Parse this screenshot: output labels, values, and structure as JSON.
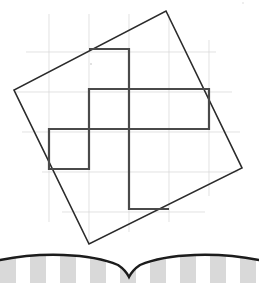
{
  "page": {
    "background_color": "#ffffff",
    "width": 259,
    "height": 283
  },
  "figure": {
    "name": "pinwheel-in-rotated-square",
    "grid": {
      "visible": true,
      "color": "#d6d6d6",
      "stroke_width": 0.7,
      "spacing": 40,
      "vertical_lines_x": [
        49,
        89,
        129,
        169,
        209
      ],
      "horizontal_lines_y": [
        52,
        92,
        132,
        172,
        212
      ]
    },
    "rotated_square": {
      "color": "#2b2b2b",
      "stroke_width": 1.6,
      "fill": "none",
      "vertices": [
        {
          "label": "top",
          "x": 166,
          "y": 11
        },
        {
          "label": "right",
          "x": 242,
          "y": 168
        },
        {
          "label": "bottom",
          "x": 89,
          "y": 244
        },
        {
          "label": "left",
          "x": 14,
          "y": 90
        }
      ],
      "points_attr": "166,11 242,168 89,244 14,90"
    },
    "pinwheel": {
      "color": "#4a4a4a",
      "stroke_width": 2.2,
      "fill": "none",
      "center": {
        "x": 129,
        "y": 129
      },
      "points_attr": "89,49 129,49 129,129 209,129 209,89 89,89 89,169 49,169 49,129 129,129 129,209 169,209",
      "segments": [
        {
          "name": "arm-top-left-horizontal",
          "x1": 89,
          "y1": 49,
          "x2": 129,
          "y2": 49
        },
        {
          "name": "arm-top-vertical",
          "x1": 129,
          "y1": 49,
          "x2": 129,
          "y2": 129
        },
        {
          "name": "arm-right-horizontal-upper",
          "x1": 129,
          "y1": 89,
          "x2": 209,
          "y2": 89
        },
        {
          "name": "arm-right-vertical",
          "x1": 209,
          "y1": 89,
          "x2": 209,
          "y2": 129
        },
        {
          "name": "arm-right-horizontal-lower",
          "x1": 129,
          "y1": 129,
          "x2": 209,
          "y2": 129
        },
        {
          "name": "arm-left-horizontal",
          "x1": 49,
          "y1": 129,
          "x2": 129,
          "y2": 129
        },
        {
          "name": "arm-left-vertical",
          "x1": 49,
          "y1": 129,
          "x2": 49,
          "y2": 169
        },
        {
          "name": "arm-bottom-vertical",
          "x1": 129,
          "y1": 129,
          "x2": 129,
          "y2": 209
        },
        {
          "name": "arm-bottom-horizontal",
          "x1": 129,
          "y1": 209,
          "x2": 169,
          "y2": 209
        }
      ]
    },
    "speck_marks": [
      {
        "name": "scan-speck-upper-left",
        "x": 91,
        "y": 64,
        "r": 0.8
      },
      {
        "name": "scan-speck-top-right",
        "x": 243,
        "y": 3,
        "r": 0.7
      }
    ]
  },
  "page_fold": {
    "name": "book-spine-fold",
    "curve_color": "#1c1c1c",
    "curve_width": 2.4,
    "curve_path": "M 0,17 C 40,9 90,10 118,22 C 124,26 127,30 129,34 C 131,30 134,26 140,22 C 168,10 218,9 259,17",
    "stripes": {
      "color": "#d9d9d9",
      "background": "#ffffff",
      "count": 9,
      "width": 16,
      "gap": 14,
      "top_y": 20,
      "height": 20
    }
  }
}
